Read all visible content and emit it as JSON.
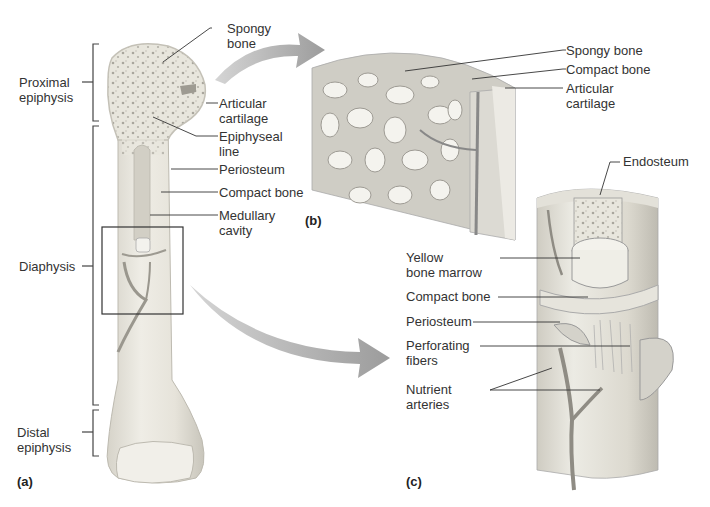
{
  "figure": {
    "panels": {
      "a": "(a)",
      "b": "(b)",
      "c": "(c)"
    },
    "panel_a_labels": {
      "proximal_epiphysis": [
        "Proximal",
        "epiphysis"
      ],
      "diaphysis": [
        "Diaphysis"
      ],
      "distal_epiphysis": [
        "Distal",
        "epiphysis"
      ],
      "spongy_bone": [
        "Spongy",
        "bone"
      ],
      "articular_cartilage": [
        "Articular",
        "cartilage"
      ],
      "epiphyseal_line": [
        "Epiphyseal",
        "line"
      ],
      "periosteum": [
        "Periosteum"
      ],
      "compact_bone": [
        "Compact bone"
      ],
      "medullary_cavity": [
        "Medullary",
        "cavity"
      ]
    },
    "panel_b_labels": {
      "spongy_bone": [
        "Spongy bone"
      ],
      "compact_bone": [
        "Compact bone"
      ],
      "articular_cartilage": [
        "Articular",
        "cartilage"
      ]
    },
    "panel_c_labels": {
      "endosteum": [
        "Endosteum"
      ],
      "yellow_bone_marrow": [
        "Yellow",
        "bone marrow"
      ],
      "compact_bone": [
        "Compact bone"
      ],
      "periosteum": [
        "Periosteum"
      ],
      "perforating_fibers": [
        "Perforating",
        "fibers"
      ],
      "nutrient_arteries": [
        "Nutrient",
        "arteries"
      ]
    },
    "colors": {
      "bone": "#e9e7df",
      "bone_shadow": "#c9c6bc",
      "arrow": "#a8a8a8",
      "leader_line": "#333333",
      "bracket": "#444444"
    }
  }
}
